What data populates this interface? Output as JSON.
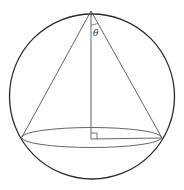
{
  "figure": {
    "colors": {
      "outline": "#2a2a2a",
      "lines": "#555555",
      "background": "#ffffff"
    },
    "sphere": {
      "cx": 92,
      "cy": 96.5,
      "r": 82.5
    },
    "apex": {
      "x": 91,
      "y": 11
    },
    "base_ellipse": {
      "cx": 91.5,
      "cy": 137.5,
      "rx": 70,
      "ry": 10
    },
    "base_left": {
      "x": 22,
      "y": 137
    },
    "base_right": {
      "x": 162,
      "y": 138
    },
    "height_foot": {
      "x": 91,
      "y": 139
    },
    "right_angle_box_size": 6,
    "labels": {
      "angle": "θ"
    },
    "angle_label_pos": {
      "x": 93,
      "y": 36
    }
  }
}
